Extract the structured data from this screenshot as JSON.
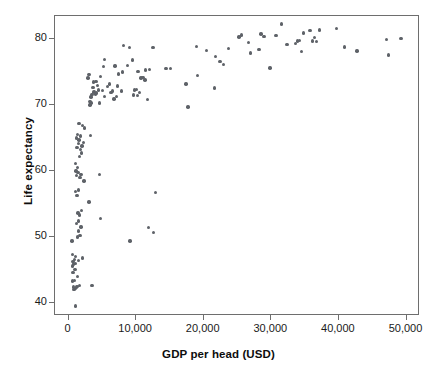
{
  "chart_data": {
    "type": "scatter",
    "title": "",
    "xlabel": "GDP per head (USD)",
    "ylabel": "Life expectancy",
    "xlim": [
      -2000,
      52000
    ],
    "ylim": [
      38,
      83.5
    ],
    "grid": false,
    "legend": null,
    "marker": {
      "color": "#5e6268",
      "shape": "circle",
      "size": 3.4
    },
    "xticks": [
      0,
      10000,
      20000,
      30000,
      40000,
      50000
    ],
    "xticklabels": [
      "0",
      "10,000",
      "20,000",
      "30,000",
      "40,000",
      "50,000"
    ],
    "yticks": [
      40,
      50,
      60,
      70,
      80
    ],
    "yticklabels": [
      "40",
      "50",
      "60",
      "70",
      "80"
    ],
    "series": [
      {
        "name": "Countries",
        "points": [
          [
            1050,
            39.5
          ],
          [
            700,
            42.0
          ],
          [
            900,
            42.1
          ],
          [
            1000,
            42.2
          ],
          [
            1150,
            42.3
          ],
          [
            780,
            42.4
          ],
          [
            1250,
            42.5
          ],
          [
            1600,
            42.6
          ],
          [
            3450,
            42.6
          ],
          [
            620,
            43.3
          ],
          [
            880,
            43.4
          ],
          [
            1300,
            44.0
          ],
          [
            650,
            44.6
          ],
          [
            950,
            45.1
          ],
          [
            560,
            45.6
          ],
          [
            760,
            45.9
          ],
          [
            1000,
            46.0
          ],
          [
            690,
            46.3
          ],
          [
            1480,
            46.4
          ],
          [
            880,
            46.6
          ],
          [
            2050,
            46.8
          ],
          [
            1020,
            47.0
          ],
          [
            620,
            47.3
          ],
          [
            520,
            49.4
          ],
          [
            9100,
            49.4
          ],
          [
            1350,
            50.0
          ],
          [
            1700,
            50.2
          ],
          [
            12600,
            50.7
          ],
          [
            1500,
            50.9
          ],
          [
            11800,
            51.4
          ],
          [
            1850,
            51.5
          ],
          [
            1200,
            52.0
          ],
          [
            1450,
            52.4
          ],
          [
            4700,
            52.8
          ],
          [
            1600,
            53.3
          ],
          [
            1400,
            53.6
          ],
          [
            1900,
            54.0
          ],
          [
            3000,
            55.3
          ],
          [
            1250,
            56.3
          ],
          [
            12900,
            56.7
          ],
          [
            1050,
            56.9
          ],
          [
            1500,
            57.1
          ],
          [
            2300,
            58.5
          ],
          [
            1700,
            59.0
          ],
          [
            1150,
            59.3
          ],
          [
            1850,
            59.5
          ],
          [
            4600,
            59.5
          ],
          [
            1400,
            59.8
          ],
          [
            1100,
            60.0
          ],
          [
            1300,
            60.5
          ],
          [
            1000,
            61.1
          ],
          [
            1600,
            62.2
          ],
          [
            1900,
            62.7
          ],
          [
            1750,
            63.3
          ],
          [
            1250,
            63.6
          ],
          [
            2000,
            63.8
          ],
          [
            1450,
            64.2
          ],
          [
            2250,
            64.3
          ],
          [
            1550,
            64.7
          ],
          [
            1150,
            65.0
          ],
          [
            1800,
            65.3
          ],
          [
            3250,
            65.4
          ],
          [
            1350,
            65.5
          ],
          [
            2350,
            66.5
          ],
          [
            2050,
            66.9
          ],
          [
            1550,
            67.2
          ],
          [
            17700,
            69.7
          ],
          [
            3150,
            70.0
          ],
          [
            3300,
            70.3
          ],
          [
            4550,
            70.3
          ],
          [
            3200,
            70.5
          ],
          [
            11650,
            70.8
          ],
          [
            6700,
            70.9
          ],
          [
            3350,
            71.2
          ],
          [
            5300,
            71.3
          ],
          [
            7100,
            71.3
          ],
          [
            10200,
            71.4
          ],
          [
            9600,
            71.5
          ],
          [
            3500,
            71.6
          ],
          [
            3950,
            71.7
          ],
          [
            4100,
            71.8
          ],
          [
            6300,
            71.9
          ],
          [
            10500,
            71.9
          ],
          [
            3750,
            72.0
          ],
          [
            6500,
            72.1
          ],
          [
            7800,
            72.1
          ],
          [
            5050,
            72.2
          ],
          [
            4400,
            72.3
          ],
          [
            9800,
            72.3
          ],
          [
            10050,
            72.4
          ],
          [
            21600,
            72.6
          ],
          [
            3600,
            72.7
          ],
          [
            5800,
            72.8
          ],
          [
            7200,
            72.9
          ],
          [
            4250,
            73.0
          ],
          [
            6100,
            73.2
          ],
          [
            17400,
            73.2
          ],
          [
            3700,
            73.5
          ],
          [
            4050,
            73.6
          ],
          [
            11300,
            73.8
          ],
          [
            2900,
            74.1
          ],
          [
            10700,
            74.1
          ],
          [
            11000,
            74.2
          ],
          [
            4700,
            74.3
          ],
          [
            19100,
            74.5
          ],
          [
            3050,
            74.6
          ],
          [
            7400,
            74.7
          ],
          [
            7950,
            75.0
          ],
          [
            10300,
            75.1
          ],
          [
            11400,
            75.3
          ],
          [
            12000,
            75.4
          ],
          [
            14400,
            75.5
          ],
          [
            15100,
            75.5
          ],
          [
            29800,
            75.6
          ],
          [
            5150,
            75.8
          ],
          [
            6850,
            75.9
          ],
          [
            8700,
            76.0
          ],
          [
            22900,
            76.1
          ],
          [
            22400,
            76.6
          ],
          [
            9500,
            76.8
          ],
          [
            5350,
            76.9
          ],
          [
            21700,
            77.4
          ],
          [
            47300,
            77.6
          ],
          [
            26900,
            77.9
          ],
          [
            34500,
            78.1
          ],
          [
            42700,
            78.2
          ],
          [
            20400,
            78.3
          ],
          [
            28200,
            78.4
          ],
          [
            23700,
            78.6
          ],
          [
            12500,
            78.7
          ],
          [
            9000,
            78.7
          ],
          [
            40800,
            78.8
          ],
          [
            18900,
            78.9
          ],
          [
            8100,
            79.0
          ],
          [
            32300,
            79.2
          ],
          [
            33600,
            79.3
          ],
          [
            26600,
            79.5
          ],
          [
            36700,
            79.6
          ],
          [
            36100,
            79.7
          ],
          [
            33900,
            79.7
          ],
          [
            34200,
            79.8
          ],
          [
            47000,
            79.9
          ],
          [
            49200,
            80.1
          ],
          [
            36400,
            80.2
          ],
          [
            25200,
            80.3
          ],
          [
            28900,
            80.4
          ],
          [
            30700,
            80.5
          ],
          [
            25600,
            80.6
          ],
          [
            28500,
            80.8
          ],
          [
            34800,
            80.9
          ],
          [
            35700,
            81.3
          ],
          [
            37100,
            81.4
          ],
          [
            39600,
            81.6
          ],
          [
            31500,
            82.3
          ]
        ]
      }
    ]
  }
}
